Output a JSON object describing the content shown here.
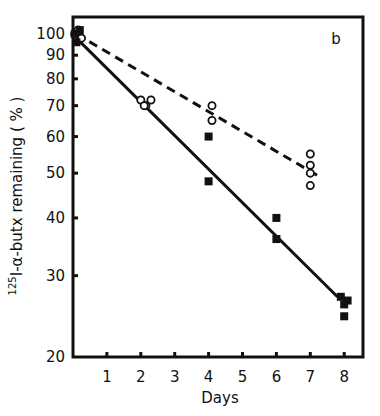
{
  "chart_data": {
    "type": "scatter",
    "panel_label": "b",
    "title": "",
    "xlabel": "Days",
    "ylabel": "125I-α-butx remaining (%)",
    "ylabel_parts": {
      "superscript": "125",
      "text": "I-α-butx remaining ( % )"
    },
    "yscale": "log",
    "xlim": [
      0,
      8.5
    ],
    "ylim": [
      20,
      110
    ],
    "x_ticks": [
      "1",
      "2",
      "3",
      "4",
      "5",
      "6",
      "7",
      "8"
    ],
    "y_ticks": [
      "100",
      "90",
      "80",
      "70",
      "60",
      "50",
      "40",
      "30",
      "20"
    ],
    "grid": false,
    "series": [
      {
        "name": "open circles (dashed fit)",
        "marker": "open-circle",
        "line_style": "dashed",
        "points": [
          {
            "x": 0.05,
            "y": 100
          },
          {
            "x": 0.15,
            "y": 102
          },
          {
            "x": 0.25,
            "y": 98
          },
          {
            "x": 2.0,
            "y": 72
          },
          {
            "x": 2.15,
            "y": 70
          },
          {
            "x": 2.3,
            "y": 72
          },
          {
            "x": 2.1,
            "y": 70
          },
          {
            "x": 4.1,
            "y": 70
          },
          {
            "x": 4.1,
            "y": 65
          },
          {
            "x": 7.0,
            "y": 55
          },
          {
            "x": 7.0,
            "y": 52
          },
          {
            "x": 7.0,
            "y": 50
          },
          {
            "x": 7.0,
            "y": 47
          }
        ],
        "fit": [
          {
            "x": 0.1,
            "y": 100
          },
          {
            "x": 7.3,
            "y": 49
          }
        ]
      },
      {
        "name": "filled squares (solid fit)",
        "marker": "filled-square",
        "line_style": "solid",
        "points": [
          {
            "x": 0.05,
            "y": 100
          },
          {
            "x": 0.1,
            "y": 96
          },
          {
            "x": 0.2,
            "y": 102
          },
          {
            "x": 4.0,
            "y": 60
          },
          {
            "x": 4.0,
            "y": 48
          },
          {
            "x": 6.0,
            "y": 40
          },
          {
            "x": 6.0,
            "y": 36
          },
          {
            "x": 7.9,
            "y": 27
          },
          {
            "x": 8.0,
            "y": 26
          },
          {
            "x": 8.1,
            "y": 26.5
          },
          {
            "x": 8.0,
            "y": 24.5
          }
        ],
        "fit": [
          {
            "x": 0.1,
            "y": 98
          },
          {
            "x": 7.8,
            "y": 27
          }
        ]
      }
    ]
  }
}
